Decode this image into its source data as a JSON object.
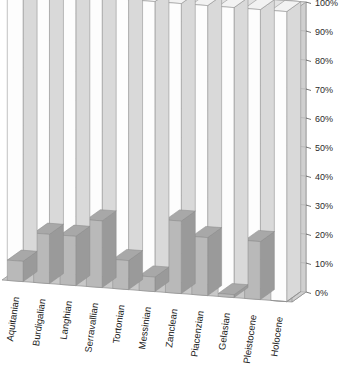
{
  "chart_data": {
    "type": "bar",
    "title": "",
    "subtitle": "",
    "xlabel": "",
    "ylabel": "",
    "ylim": [
      0,
      100
    ],
    "grid": true,
    "legend": false,
    "style": "3d-column-stacked-100-percent",
    "categories": [
      "Aquitanian",
      "Burdigalian",
      "Langhian",
      "Serravallian",
      "Tortonian",
      "Messinian",
      "Zanclean",
      "Piacenzian",
      "Gelasian",
      "Pleistocene",
      "Holocene"
    ],
    "ytick_labels": [
      "0%",
      "10%",
      "20%",
      "30%",
      "40%",
      "50%",
      "60%",
      "70%",
      "80%",
      "90%",
      "100%"
    ],
    "ytick_values": [
      0,
      10,
      20,
      30,
      40,
      50,
      60,
      70,
      80,
      90,
      100
    ],
    "series": [
      {
        "name": "filled",
        "color": "#b9b9b9",
        "values": [
          7,
          17,
          17,
          23,
          10,
          5,
          25,
          20,
          1,
          20,
          0
        ]
      },
      {
        "name": "remainder",
        "color": "#ffffff",
        "values": [
          93,
          83,
          83,
          77,
          90,
          95,
          75,
          80,
          99,
          80,
          100
        ]
      }
    ],
    "values": [
      7,
      17,
      17,
      23,
      10,
      5,
      25,
      20,
      1,
      20,
      0
    ]
  },
  "colors": {
    "fill_gray": "#b9b9b9",
    "fill_white": "#fdfdfd",
    "side_gray": "#9a9a9a",
    "side_light": "#d9d9d9",
    "wall": "#e3e3e3",
    "wall_side": "#cfcfcf",
    "floor": "#c8c8c8",
    "outline": "#8d8d8d",
    "gridline": "#b0b0b0",
    "text": "#222222"
  }
}
